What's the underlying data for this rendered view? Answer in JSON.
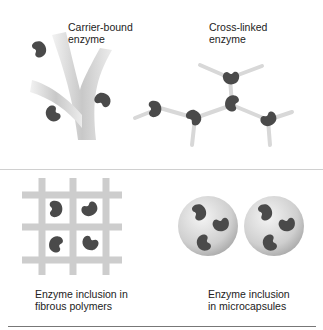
{
  "panels": [
    {
      "id": "carrier-bound",
      "label": "Carrier-bound\nenzyme"
    },
    {
      "id": "cross-linked",
      "label": "Cross-linked\nenzyme"
    },
    {
      "id": "fibrous",
      "label": "Enzyme inclusion in\nfibrous polymers"
    },
    {
      "id": "microcapsules",
      "label": "Enzyme inclusion\nin microcapsules"
    }
  ],
  "colors": {
    "enzyme": "#4a4a4a",
    "carrier": "#d8d8d8",
    "divider": "#c8c8c8"
  }
}
